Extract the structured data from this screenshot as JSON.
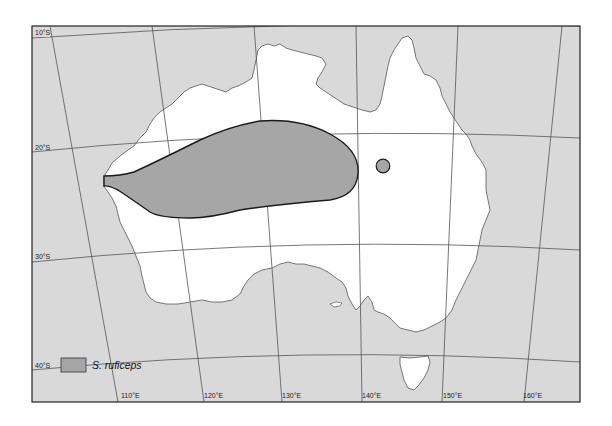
{
  "map": {
    "title": "Distribution map",
    "region": "Australia",
    "colors": {
      "ocean": "#d9d9d9",
      "land": "#ffffff",
      "range_fill": "#a6a6a6",
      "range_stroke": "#1a1a1a",
      "graticule": "#555555",
      "frame": "#222222"
    },
    "latitude_labels": [
      "10°S",
      "20°S",
      "30°S",
      "40°S"
    ],
    "longitude_labels": [
      "110°E",
      "120°E",
      "130°E",
      "140°E",
      "150°E",
      "160°E"
    ]
  },
  "legend": {
    "items": [
      {
        "label": "S. ruficeps",
        "swatch_color": "#a6a6a6"
      }
    ]
  }
}
